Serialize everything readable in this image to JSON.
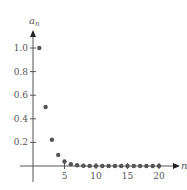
{
  "chart_data": {
    "type": "scatter",
    "title": "",
    "xlabel": "n",
    "ylabel": "a_n",
    "ylabel_main": "a",
    "ylabel_sub": "n",
    "x_ticks": [
      5,
      10,
      15,
      20
    ],
    "x_tick_labels": [
      "5",
      "10",
      "15",
      "20"
    ],
    "y_ticks": [
      0.2,
      0.4,
      0.6,
      0.8,
      1.0
    ],
    "y_tick_labels": [
      "0.2",
      "0.4",
      "0.6",
      "0.8",
      "1.0"
    ],
    "xlim": [
      0,
      23
    ],
    "ylim": [
      0,
      1.15
    ],
    "grid": false,
    "legend": null,
    "series": [
      {
        "name": "a_n",
        "x": [
          1,
          2,
          3,
          4,
          5,
          6,
          7,
          8,
          9,
          10,
          11,
          12,
          13,
          14,
          15,
          16,
          17,
          18,
          19,
          20
        ],
        "values": [
          1.0,
          0.5,
          0.222,
          0.094,
          0.038,
          0.015,
          0.006,
          0.002,
          0.001,
          0.0004,
          0.0001,
          0.0,
          0.0,
          0.0,
          0.0,
          0.0,
          0.0,
          0.0,
          0.0,
          0.0
        ]
      }
    ],
    "colors": {
      "axis": "#555555",
      "point": "#555555"
    }
  }
}
